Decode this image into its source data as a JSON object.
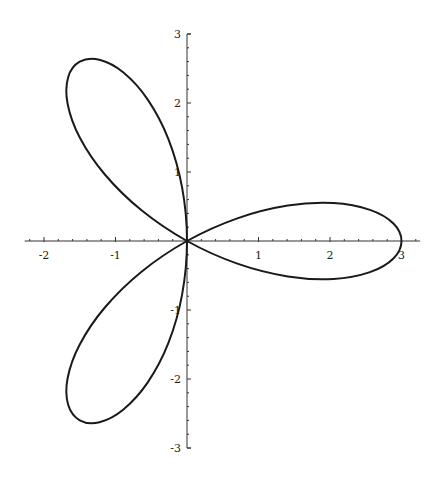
{
  "chart_data": {
    "type": "line",
    "subtype": "polar-parametric",
    "title": "",
    "xlabel": "",
    "ylabel": "",
    "xlim": [
      -2.27,
      3.26
    ],
    "ylim": [
      -3.0,
      3.0
    ],
    "grid": false,
    "legend": null,
    "x_ticks": [
      -2,
      -1,
      1,
      2,
      3
    ],
    "x_tick_labels": [
      "-2",
      "-1",
      "1",
      "2",
      "3"
    ],
    "y_ticks": [
      -3,
      -2,
      -1,
      1,
      2,
      3
    ],
    "y_tick_labels": [
      "-3",
      "-2",
      "-1",
      "1",
      "2",
      "3"
    ],
    "minor_tick_step": 0.2,
    "series": [
      {
        "name": "rose",
        "color": "#1a1a1a",
        "points": [
          [
            3.0,
            0.0
          ],
          [
            2.887,
            0.253
          ],
          [
            2.559,
            0.451
          ],
          [
            2.049,
            0.549
          ],
          [
            1.41,
            0.513
          ],
          [
            0.704,
            0.328
          ],
          [
            0.0,
            0.0
          ],
          [
            -0.636,
            -0.445
          ],
          [
            -1.149,
            -0.964
          ],
          [
            -1.5,
            -1.5
          ],
          [
            -1.67,
            -1.99
          ],
          [
            -1.662,
            -2.374
          ],
          [
            -1.5,
            -2.598
          ],
          [
            -1.225,
            -2.626
          ],
          [
            -0.889,
            -2.441
          ],
          [
            -0.549,
            -2.049
          ],
          [
            -0.26,
            -1.477
          ],
          [
            -0.068,
            -0.773
          ],
          [
            0.0,
            0.0
          ],
          [
            -0.068,
            0.773
          ],
          [
            -0.26,
            1.477
          ],
          [
            -0.549,
            2.049
          ],
          [
            -0.889,
            2.441
          ],
          [
            -1.225,
            2.626
          ],
          [
            -1.5,
            2.598
          ],
          [
            -1.662,
            2.374
          ],
          [
            -1.67,
            1.99
          ],
          [
            -1.5,
            1.5
          ],
          [
            -1.149,
            0.964
          ],
          [
            -0.636,
            0.445
          ],
          [
            0.0,
            0.0
          ],
          [
            0.704,
            -0.328
          ],
          [
            1.41,
            -0.513
          ],
          [
            2.049,
            -0.549
          ],
          [
            2.559,
            -0.451
          ],
          [
            2.887,
            -0.253
          ],
          [
            3.0,
            0.0
          ]
        ]
      }
    ]
  },
  "axes": {
    "origin_px": [
      187,
      241
    ],
    "scale_px": [
      71.5,
      69
    ],
    "axis_color": "#333333",
    "curve_color": "#1a1a1a"
  }
}
